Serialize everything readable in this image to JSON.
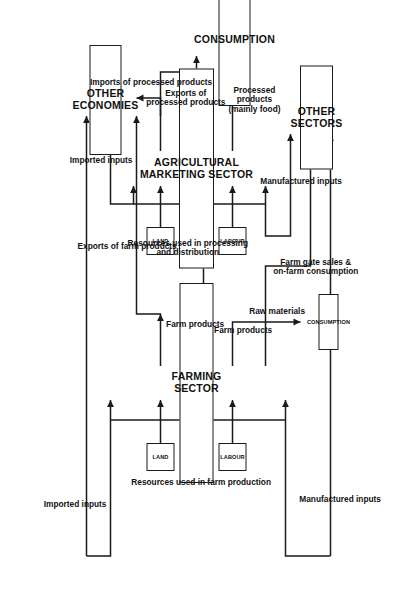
{
  "diagram": {
    "orientation": "rotated-90",
    "boxes": {
      "farming_sector": "FARMING SECTOR",
      "agricultural_marketing_sector": "AGRICULTURAL\nMARKETING SECTOR",
      "other_economies": "OTHER ECONOMIES",
      "other_sectors": "OTHER SECTORS",
      "consumption_main": "CONSUMPTION",
      "consumption_small": "CONSUMPTION",
      "land_farm": "LAND",
      "labour_farm": "LABOUR",
      "land_marketing": "LAND",
      "labour_marketing": "LABOUR"
    },
    "labels": {
      "imported_inputs_farm": "Imported inputs",
      "imported_inputs_marketing": "Imported inputs",
      "manufactured_inputs_farm": "Manufactured inputs",
      "manufactured_inputs_marketing": "Manufactured inputs",
      "resources_used_in_farm_production": "Resources used in farm production",
      "resources_used_in_processing": "Resources used in processing\nand distribution",
      "exports_of_farm_products": "Exports of farm products",
      "exports_of_processed_products": "Exports of\nprocessed products",
      "imports_of_processed_products": "Imports of processed products",
      "farm_products_a": "Farm products",
      "farm_products_b": "Farm products",
      "farm_gate_sales": "Farm gate sales &\non-farm consumption",
      "raw_materials": "Raw materials",
      "processed_products": "Processed\nproducts\n(mainly food)"
    },
    "colors": {
      "ink": "#1a1a1a",
      "background": "#ffffff"
    }
  }
}
